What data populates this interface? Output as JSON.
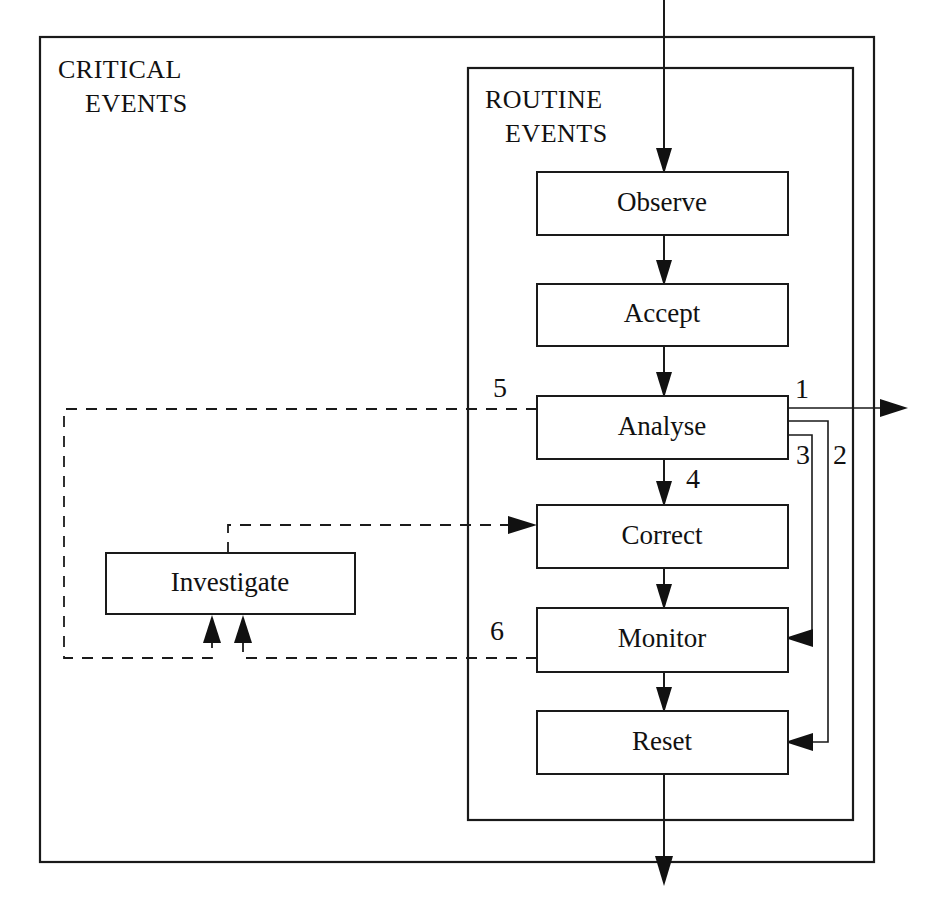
{
  "diagram": {
    "canvas": {
      "width": 938,
      "height": 903
    },
    "colors": {
      "stroke": "#1a1a1a",
      "fill": "#ffffff",
      "text": "#111111"
    },
    "containers": [
      {
        "id": "critical-events",
        "label_line1": "CRITICAL",
        "label_line2": "EVENTS",
        "x": 40,
        "y": 37,
        "width": 834,
        "height": 825
      },
      {
        "id": "routine-events",
        "label_line1": "ROUTINE",
        "label_line2": "EVENTS",
        "x": 468,
        "y": 68,
        "width": 385,
        "height": 752
      }
    ],
    "nodes": [
      {
        "id": "observe",
        "label": "Observe",
        "x": 537,
        "y": 172,
        "width": 251,
        "height": 63
      },
      {
        "id": "accept",
        "label": "Accept",
        "x": 537,
        "y": 284,
        "width": 251,
        "height": 62
      },
      {
        "id": "analyse",
        "label": "Analyse",
        "x": 537,
        "y": 396,
        "width": 251,
        "height": 63
      },
      {
        "id": "correct",
        "label": "Correct",
        "x": 537,
        "y": 505,
        "width": 251,
        "height": 63
      },
      {
        "id": "monitor",
        "label": "Monitor",
        "x": 537,
        "y": 608,
        "width": 251,
        "height": 64
      },
      {
        "id": "reset",
        "label": "Reset",
        "x": 537,
        "y": 711,
        "width": 251,
        "height": 63
      },
      {
        "id": "investigate",
        "label": "Investigate",
        "x": 106,
        "y": 553,
        "width": 249,
        "height": 61
      }
    ],
    "edge_numbers": [
      {
        "id": "edge-label-1",
        "label": "1",
        "x": 802,
        "y": 392
      },
      {
        "id": "edge-label-2",
        "label": "2",
        "x": 840,
        "y": 458
      },
      {
        "id": "edge-label-3",
        "label": "3",
        "x": 803,
        "y": 458
      },
      {
        "id": "edge-label-4",
        "label": "4",
        "x": 693,
        "y": 482
      },
      {
        "id": "edge-label-5",
        "label": "5",
        "x": 500,
        "y": 391
      },
      {
        "id": "edge-label-6",
        "label": "6",
        "x": 497,
        "y": 634
      }
    ],
    "edges": [
      {
        "id": "input-to-observe",
        "style": "solid",
        "from": "external-top",
        "to": "observe"
      },
      {
        "id": "observe-to-accept",
        "style": "solid",
        "from": "observe",
        "to": "accept"
      },
      {
        "id": "accept-to-analyse",
        "style": "solid",
        "from": "accept",
        "to": "analyse"
      },
      {
        "id": "analyse-to-external-1",
        "style": "solid",
        "from": "analyse",
        "to": "external-right",
        "number": "1"
      },
      {
        "id": "analyse-to-reset-2",
        "style": "solid",
        "from": "analyse",
        "to": "reset",
        "number": "2"
      },
      {
        "id": "analyse-to-monitor-3",
        "style": "solid",
        "from": "analyse",
        "to": "monitor",
        "number": "3"
      },
      {
        "id": "analyse-to-correct-4",
        "style": "solid",
        "from": "analyse",
        "to": "correct",
        "number": "4"
      },
      {
        "id": "analyse-to-investigate-5",
        "style": "dashed",
        "from": "analyse",
        "to": "investigate",
        "number": "5"
      },
      {
        "id": "monitor-to-investigate-6",
        "style": "dashed",
        "from": "monitor",
        "to": "investigate",
        "number": "6"
      },
      {
        "id": "investigate-to-correct",
        "style": "dashed",
        "from": "investigate",
        "to": "correct"
      },
      {
        "id": "correct-to-monitor",
        "style": "solid",
        "from": "correct",
        "to": "monitor"
      },
      {
        "id": "monitor-to-reset",
        "style": "solid",
        "from": "monitor",
        "to": "reset"
      },
      {
        "id": "reset-to-external",
        "style": "solid",
        "from": "reset",
        "to": "external-bottom"
      }
    ]
  }
}
